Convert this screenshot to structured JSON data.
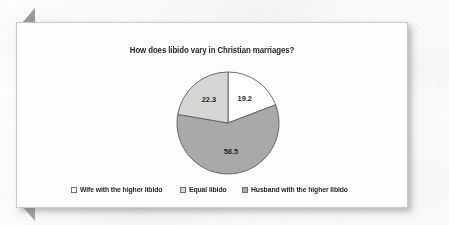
{
  "card": {
    "title": "How does libido vary in Christian marriages?"
  },
  "legend": {
    "items": [
      {
        "label": "Wife with the higher libido",
        "color": "#ffffff",
        "swatch_name": "legend-swatch-wife"
      },
      {
        "label": "Equal libido",
        "color": "#d6d6d4",
        "swatch_name": "legend-swatch-equal"
      },
      {
        "label": "Husband with the higher libido",
        "color": "#a9a9a7",
        "swatch_name": "legend-swatch-husband"
      }
    ]
  },
  "chart_data": {
    "type": "pie",
    "title": "How does libido vary in Christian marriages?",
    "xlabel": "",
    "ylabel": "",
    "categories": [
      "Wife with the higher libido",
      "Husband with the higher libido",
      "Equal libido"
    ],
    "values": [
      19.2,
      58.5,
      22.3
    ],
    "labels": [
      "19.2",
      "58.5",
      "22.3"
    ],
    "colors": [
      "#ffffff",
      "#a9a9a7",
      "#d6d6d4"
    ],
    "start_angle_deg": 0,
    "direction": "clockwise",
    "legend_position": "bottom",
    "grid": false,
    "units": "percent"
  }
}
